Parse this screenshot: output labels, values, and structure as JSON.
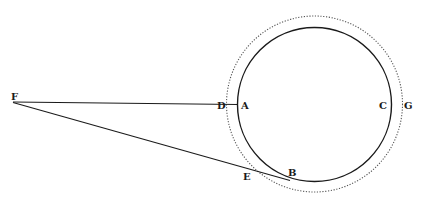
{
  "diagram": {
    "colors": {
      "ink": "#1a1a1a",
      "dotted": "#555555",
      "background": "#ffffff"
    },
    "labels": {
      "F": "F",
      "D": "D",
      "A": "A",
      "C": "C",
      "G": "G",
      "E": "E",
      "B": "B"
    },
    "inner_circle": {
      "style": "solid",
      "cx": 314,
      "cy": 104,
      "r": 76
    },
    "outer_circle": {
      "style": "dotted",
      "cx": 314,
      "cy": 104,
      "r": 88
    },
    "lines": [
      {
        "name": "FA",
        "from": "F",
        "to": "A"
      },
      {
        "name": "FB",
        "from": "F",
        "to": "B"
      }
    ]
  }
}
